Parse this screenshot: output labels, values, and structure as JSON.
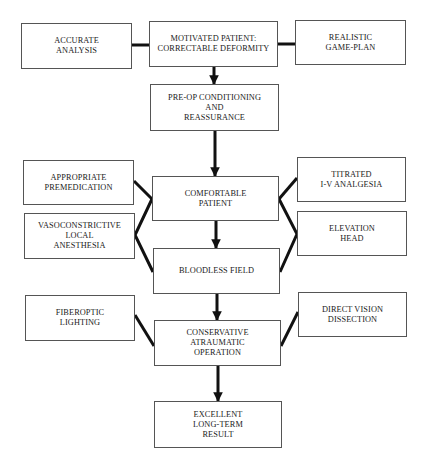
{
  "diagram": {
    "nodes": {
      "accurate_analysis": "ACCURATE\nANALYSIS",
      "motivated_patient": "MOTIVATED PATIENT:\nCORRECTABLE DEFORMITY",
      "realistic_game_plan": "REALISTIC\nGAME-PLAN",
      "preop_conditioning": "PRE-OP CONDITIONING\nAND\nREASSURANCE",
      "appropriate_premedication": "APPROPRIATE\nPREMEDICATION",
      "comfortable_patient": "COMFORTABLE\nPATIENT",
      "titrated_iv_analgesia": "TITRATED\nI-V ANALGESIA",
      "vasoconstrictive_local_anesthesia": "VASOCONSTRICTIVE\nLOCAL\nANESTHESIA",
      "elevation_head": "ELEVATION\nHEAD",
      "bloodless_field": "BLOODLESS FIELD",
      "fiberoptic_lighting": "FIBEROPTIC\nLIGHTING",
      "direct_vision_dissection": "DIRECT VISION\nDISSECTION",
      "conservative_atraumatic_operation": "CONSERVATIVE\nATRAUMATIC\nOPERATION",
      "excellent_long_term_result": "EXCELLENT\nLONG-TERM\nRESULT"
    },
    "edges": [
      {
        "from": "accurate_analysis",
        "to": "motivated_patient",
        "type": "line"
      },
      {
        "from": "realistic_game_plan",
        "to": "motivated_patient",
        "type": "line"
      },
      {
        "from": "motivated_patient",
        "to": "preop_conditioning",
        "type": "arrow"
      },
      {
        "from": "preop_conditioning",
        "to": "comfortable_patient",
        "type": "arrow"
      },
      {
        "from": "appropriate_premedication",
        "to": "comfortable_patient",
        "type": "line"
      },
      {
        "from": "vasoconstrictive_local_anesthesia",
        "to": "comfortable_patient",
        "type": "line"
      },
      {
        "from": "vasoconstrictive_local_anesthesia",
        "to": "bloodless_field",
        "type": "line"
      },
      {
        "from": "titrated_iv_analgesia",
        "to": "comfortable_patient",
        "type": "line"
      },
      {
        "from": "elevation_head",
        "to": "comfortable_patient",
        "type": "line"
      },
      {
        "from": "elevation_head",
        "to": "bloodless_field",
        "type": "line"
      },
      {
        "from": "comfortable_patient",
        "to": "bloodless_field",
        "type": "arrow"
      },
      {
        "from": "bloodless_field",
        "to": "conservative_atraumatic_operation",
        "type": "arrow"
      },
      {
        "from": "fiberoptic_lighting",
        "to": "conservative_atraumatic_operation",
        "type": "line"
      },
      {
        "from": "direct_vision_dissection",
        "to": "conservative_atraumatic_operation",
        "type": "line"
      },
      {
        "from": "conservative_atraumatic_operation",
        "to": "excellent_long_term_result",
        "type": "arrow"
      }
    ]
  }
}
